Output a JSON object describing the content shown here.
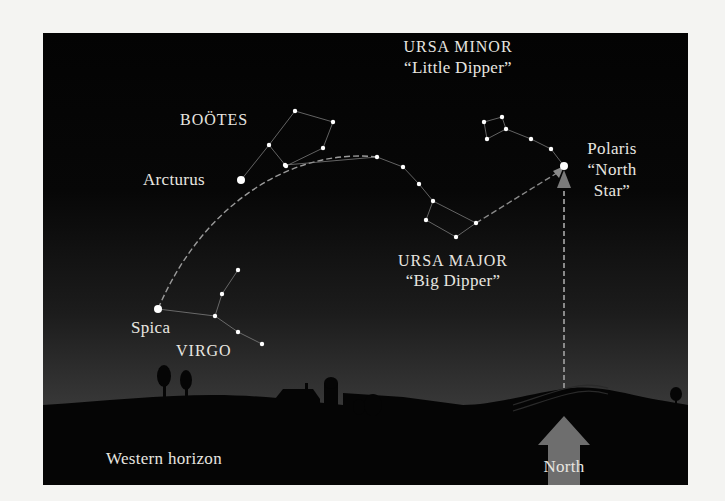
{
  "labels": {
    "bootes": "BOÖTES",
    "arcturus": "Arcturus",
    "ursa_minor_name": "URSA MINOR",
    "ursa_minor_nick": "“Little Dipper”",
    "polaris_name": "Polaris",
    "polaris_nick_1": "“North",
    "polaris_nick_2": "Star”",
    "ursa_major_name": "URSA MAJOR",
    "ursa_major_nick": "“Big Dipper”",
    "spica": "Spica",
    "virgo": "VIRGO",
    "western_horizon": "Western horizon",
    "north": "North"
  },
  "colors": {
    "star": "#ffffff",
    "line": "#8a8a8a",
    "arc": "#9a9a9a",
    "north_arrow": "#6e6e6e",
    "ground": "#050505",
    "text": "#e8e6e0"
  },
  "constellations": {
    "ursa_major": {
      "stars": [
        [
          242,
          132
        ],
        [
          334,
          124
        ],
        [
          360,
          134
        ],
        [
          376,
          151
        ],
        [
          390,
          168
        ],
        [
          383,
          187
        ],
        [
          413,
          204
        ],
        [
          433,
          190
        ]
      ],
      "lines": [
        [
          0,
          1
        ],
        [
          1,
          2
        ],
        [
          2,
          3
        ],
        [
          3,
          4
        ],
        [
          4,
          5
        ],
        [
          5,
          6
        ],
        [
          6,
          7
        ],
        [
          7,
          4
        ]
      ]
    },
    "ursa_minor": {
      "stars": [
        [
          521,
          133
        ],
        [
          508,
          116
        ],
        [
          488,
          106
        ],
        [
          463,
          96
        ],
        [
          459,
          84
        ],
        [
          441,
          89
        ],
        [
          444,
          106
        ]
      ],
      "lines": [
        [
          0,
          1
        ],
        [
          1,
          2
        ],
        [
          2,
          3
        ],
        [
          3,
          4
        ],
        [
          4,
          5
        ],
        [
          5,
          6
        ],
        [
          6,
          3
        ]
      ]
    },
    "bootes": {
      "stars": [
        [
          198,
          147
        ],
        [
          226,
          112
        ],
        [
          252,
          78
        ],
        [
          290,
          89
        ],
        [
          280,
          115
        ],
        [
          243,
          133
        ]
      ],
      "lines": [
        [
          0,
          1
        ],
        [
          1,
          2
        ],
        [
          2,
          3
        ],
        [
          3,
          4
        ],
        [
          4,
          5
        ],
        [
          5,
          1
        ]
      ]
    },
    "virgo": {
      "stars": [
        [
          115,
          276
        ],
        [
          172,
          283
        ],
        [
          195,
          299
        ],
        [
          219,
          311
        ],
        [
          179,
          261
        ],
        [
          195,
          237
        ]
      ],
      "lines": [
        [
          0,
          1
        ],
        [
          1,
          2
        ],
        [
          2,
          3
        ],
        [
          1,
          4
        ],
        [
          4,
          5
        ]
      ]
    }
  },
  "bright_stars": {
    "arcturus": [
      198,
      147
    ],
    "spica": [
      115,
      276
    ],
    "polaris": [
      521,
      133
    ]
  }
}
